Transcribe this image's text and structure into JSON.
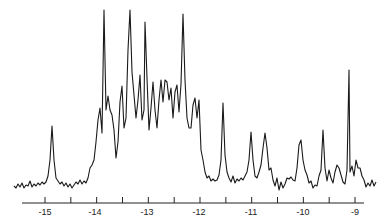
{
  "chart_data": {
    "type": "line",
    "title": "",
    "xlabel": "",
    "ylabel": "",
    "xlim": [
      -15.25,
      -8.6
    ],
    "x_reversed": false,
    "grid": false,
    "legend": null,
    "x_ticks": [
      -15,
      -14,
      -13,
      -12,
      -11,
      -10,
      -9
    ],
    "x_tick_labels": [
      "-15",
      "-14",
      "-13",
      "-12",
      "-11",
      "-10",
      "-9"
    ],
    "minor_ticks": [
      -14.5,
      -13.5,
      -12.5,
      -11.5,
      -10.5,
      -9.5
    ],
    "y_units": "relative intensity (0 = baseline, 100 = tallest peak)",
    "peaks": [
      {
        "x": -14.73,
        "y": 55
      },
      {
        "x": -13.92,
        "y": 47
      },
      {
        "x": -13.8,
        "y": 100
      },
      {
        "x": -13.72,
        "y": 50
      },
      {
        "x": -13.46,
        "y": 57
      },
      {
        "x": -13.3,
        "y": 100
      },
      {
        "x": -13.17,
        "y": 60
      },
      {
        "x": -13.0,
        "y": 94
      },
      {
        "x": -12.9,
        "y": 57
      },
      {
        "x": -12.75,
        "y": 60
      },
      {
        "x": -12.63,
        "y": 61
      },
      {
        "x": -12.56,
        "y": 57
      },
      {
        "x": -12.4,
        "y": 59
      },
      {
        "x": -12.3,
        "y": 59
      },
      {
        "x": -12.27,
        "y": 97
      },
      {
        "x": -12.07,
        "y": 47
      },
      {
        "x": -11.98,
        "y": 44
      },
      {
        "x": -11.47,
        "y": 48
      },
      {
        "x": -10.7,
        "y": 33
      },
      {
        "x": -10.35,
        "y": 32
      },
      {
        "x": -9.5,
        "y": 25
      },
      {
        "x": -9.1,
        "y": 68
      },
      {
        "x": -8.98,
        "y": 13
      },
      {
        "x": -8.85,
        "y": 13
      }
    ],
    "points": [
      [
        14,
        186
      ],
      [
        16,
        188
      ],
      [
        18,
        184
      ],
      [
        20,
        187
      ],
      [
        22,
        183
      ],
      [
        24,
        188
      ],
      [
        26,
        185
      ],
      [
        28,
        186
      ],
      [
        30,
        181
      ],
      [
        32,
        187
      ],
      [
        34,
        184
      ],
      [
        36,
        186
      ],
      [
        38,
        183
      ],
      [
        40,
        185
      ],
      [
        42,
        182
      ],
      [
        44,
        184
      ],
      [
        46,
        182
      ],
      [
        48,
        176
      ],
      [
        50,
        160
      ],
      [
        52,
        126
      ],
      [
        54,
        160
      ],
      [
        56,
        178
      ],
      [
        58,
        181
      ],
      [
        60,
        184
      ],
      [
        62,
        182
      ],
      [
        64,
        186
      ],
      [
        66,
        183
      ],
      [
        68,
        187
      ],
      [
        70,
        184
      ],
      [
        72,
        188
      ],
      [
        74,
        185
      ],
      [
        76,
        182
      ],
      [
        78,
        184
      ],
      [
        80,
        180
      ],
      [
        82,
        184
      ],
      [
        84,
        181
      ],
      [
        86,
        183
      ],
      [
        88,
        178
      ],
      [
        90,
        168
      ],
      [
        92,
        165
      ],
      [
        94,
        160
      ],
      [
        96,
        142
      ],
      [
        98,
        120
      ],
      [
        100,
        108
      ],
      [
        102,
        133
      ],
      [
        104,
        10
      ],
      [
        106,
        110
      ],
      [
        108,
        96
      ],
      [
        110,
        110
      ],
      [
        112,
        115
      ],
      [
        114,
        130
      ],
      [
        116,
        158
      ],
      [
        118,
        142
      ],
      [
        120,
        102
      ],
      [
        122,
        86
      ],
      [
        124,
        128
      ],
      [
        126,
        118
      ],
      [
        128,
        50
      ],
      [
        130,
        10
      ],
      [
        132,
        72
      ],
      [
        134,
        95
      ],
      [
        136,
        118
      ],
      [
        138,
        100
      ],
      [
        140,
        75
      ],
      [
        142,
        120
      ],
      [
        144,
        110
      ],
      [
        145,
        22
      ],
      [
        147,
        78
      ],
      [
        149,
        130
      ],
      [
        151,
        108
      ],
      [
        153,
        82
      ],
      [
        155,
        110
      ],
      [
        157,
        128
      ],
      [
        159,
        100
      ],
      [
        161,
        80
      ],
      [
        163,
        102
      ],
      [
        165,
        80
      ],
      [
        167,
        82
      ],
      [
        169,
        100
      ],
      [
        171,
        88
      ],
      [
        173,
        118
      ],
      [
        175,
        92
      ],
      [
        177,
        85
      ],
      [
        179,
        112
      ],
      [
        181,
        84
      ],
      [
        183,
        14
      ],
      [
        185,
        80
      ],
      [
        187,
        118
      ],
      [
        189,
        128
      ],
      [
        191,
        128
      ],
      [
        193,
        105
      ],
      [
        195,
        98
      ],
      [
        197,
        118
      ],
      [
        199,
        100
      ],
      [
        201,
        150
      ],
      [
        203,
        160
      ],
      [
        205,
        172
      ],
      [
        207,
        178
      ],
      [
        209,
        176
      ],
      [
        211,
        181
      ],
      [
        213,
        179
      ],
      [
        215,
        181
      ],
      [
        217,
        180
      ],
      [
        219,
        175
      ],
      [
        221,
        160
      ],
      [
        223,
        103
      ],
      [
        225,
        155
      ],
      [
        227,
        172
      ],
      [
        229,
        178
      ],
      [
        231,
        182
      ],
      [
        233,
        176
      ],
      [
        235,
        183
      ],
      [
        237,
        179
      ],
      [
        239,
        181
      ],
      [
        241,
        178
      ],
      [
        243,
        180
      ],
      [
        245,
        176
      ],
      [
        247,
        172
      ],
      [
        249,
        160
      ],
      [
        251,
        132
      ],
      [
        253,
        160
      ],
      [
        255,
        176
      ],
      [
        257,
        178
      ],
      [
        259,
        172
      ],
      [
        261,
        165
      ],
      [
        263,
        148
      ],
      [
        265,
        133
      ],
      [
        267,
        148
      ],
      [
        269,
        170
      ],
      [
        271,
        168
      ],
      [
        273,
        180
      ],
      [
        275,
        186
      ],
      [
        277,
        178
      ],
      [
        279,
        190
      ],
      [
        281,
        182
      ],
      [
        283,
        188
      ],
      [
        285,
        184
      ],
      [
        287,
        178
      ],
      [
        289,
        179
      ],
      [
        291,
        177
      ],
      [
        293,
        180
      ],
      [
        295,
        181
      ],
      [
        297,
        168
      ],
      [
        299,
        145
      ],
      [
        301,
        140
      ],
      [
        303,
        160
      ],
      [
        305,
        170
      ],
      [
        307,
        175
      ],
      [
        309,
        183
      ],
      [
        311,
        181
      ],
      [
        313,
        188
      ],
      [
        315,
        185
      ],
      [
        317,
        186
      ],
      [
        319,
        176
      ],
      [
        321,
        170
      ],
      [
        323,
        130
      ],
      [
        325,
        168
      ],
      [
        327,
        181
      ],
      [
        329,
        170
      ],
      [
        331,
        178
      ],
      [
        333,
        183
      ],
      [
        335,
        172
      ],
      [
        337,
        165
      ],
      [
        339,
        168
      ],
      [
        341,
        175
      ],
      [
        343,
        182
      ],
      [
        345,
        184
      ],
      [
        347,
        170
      ],
      [
        349,
        70
      ],
      [
        350,
        172
      ],
      [
        352,
        166
      ],
      [
        354,
        176
      ],
      [
        356,
        160
      ],
      [
        358,
        168
      ],
      [
        360,
        168
      ],
      [
        362,
        176
      ],
      [
        364,
        180
      ],
      [
        366,
        187
      ],
      [
        368,
        183
      ],
      [
        370,
        186
      ],
      [
        372,
        180
      ],
      [
        374,
        186
      ],
      [
        376,
        182
      ]
    ]
  },
  "axis": {
    "labels": [
      "-15",
      "-14",
      "-13",
      "-12",
      "-11",
      "-10",
      "-9"
    ]
  }
}
